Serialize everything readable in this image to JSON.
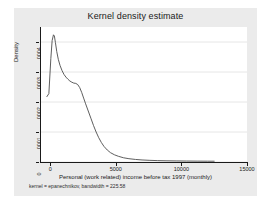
{
  "chart_data": {
    "type": "line",
    "title": "Kernel density estimate",
    "xlabel": "Personal (work related) income before tax 1997 (monthly)",
    "ylabel": "Density",
    "note": "kernel = epanechnikov, bandwidth = 225.58",
    "kernel": "epanechnikov",
    "bandwidth": 225.58,
    "xlim": [
      -700,
      15000
    ],
    "ylim": [
      0,
      0.00045
    ],
    "xticks": [
      0,
      5000,
      10000,
      15000
    ],
    "xticklabels": [
      "0",
      "5000",
      "10000",
      "15000"
    ],
    "yticks": [
      0,
      0.0001,
      0.0002,
      0.0003,
      0.0004
    ],
    "yticklabels": [
      "0",
      ".0001",
      ".0002",
      ".0003",
      ".0004"
    ],
    "grid": "horizontal",
    "legend": "none",
    "series": [
      {
        "name": "Density",
        "x": [
          -250,
          -100,
          50,
          150,
          250,
          320,
          400,
          500,
          620,
          750,
          900,
          1050,
          1200,
          1350,
          1500,
          1650,
          1800,
          1950,
          2100,
          2250,
          2400,
          2550,
          2700,
          2900,
          3100,
          3300,
          3500,
          3700,
          3900,
          4100,
          4350,
          4600,
          4900,
          5200,
          5600,
          6000,
          6500,
          7000,
          7600,
          8200,
          8900,
          9600,
          10400,
          11200,
          12000,
          12500
        ],
        "y": [
          0.000218,
          0.000228,
          0.000345,
          0.000405,
          0.000424,
          0.00042,
          0.000398,
          0.000368,
          0.000342,
          0.000322,
          0.000305,
          0.000292,
          0.000283,
          0.000276,
          0.00027,
          0.000266,
          0.000263,
          0.000262,
          0.000258,
          0.000248,
          0.000232,
          0.000213,
          0.000194,
          0.00017,
          0.000146,
          0.000122,
          0.0001,
          8.1e-05,
          6.5e-05,
          5.2e-05,
          4e-05,
          3.1e-05,
          2.4e-05,
          1.9e-05,
          1.4e-05,
          1.1e-05,
          8.5e-06,
          6.8e-06,
          5.5e-06,
          4.6e-06,
          4e-06,
          3.6e-06,
          3.2e-06,
          2.9e-06,
          2.7e-06,
          2.6e-06
        ]
      }
    ]
  },
  "style": {
    "line_color": "#4c4c4c",
    "plot_background": "#ffffff",
    "graph_background": "#ebebeb",
    "figure_background": "#ffffff",
    "grid_color": "#e6e6e6",
    "axis_color": "#1a1a1a"
  }
}
